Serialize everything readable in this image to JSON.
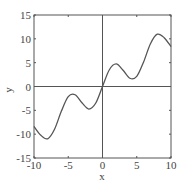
{
  "chart_data": {
    "type": "line",
    "title": "",
    "xlabel": "x",
    "ylabel": "y",
    "xlim": [
      -10,
      10
    ],
    "ylim": [
      -15,
      15
    ],
    "xticks": [
      -10,
      -5,
      0,
      5,
      10
    ],
    "yticks": [
      -15,
      -10,
      -5,
      0,
      5,
      10,
      15
    ],
    "xtick_labels": [
      "-10",
      "-5",
      "0",
      "5",
      "10"
    ],
    "ytick_labels": [
      "-15",
      "-10",
      "-5",
      "0",
      "5",
      "10",
      "15"
    ],
    "grid": false,
    "zero_lines": true,
    "legend": null,
    "series": [
      {
        "name": "y = x + 3 sin(x)",
        "color": "#555555",
        "x": [
          -10,
          -9,
          -8,
          -7,
          -6,
          -5,
          -4,
          -3,
          -2,
          -1,
          0,
          1,
          2,
          3,
          4,
          5,
          6,
          7,
          8,
          9,
          10
        ],
        "y": [
          -8.37,
          -10.24,
          -10.97,
          -8.97,
          -5.16,
          -2.12,
          -1.73,
          -3.42,
          -4.73,
          -3.52,
          0,
          3.52,
          4.73,
          3.42,
          1.73,
          2.12,
          5.16,
          8.97,
          10.97,
          10.24,
          8.37
        ]
      }
    ]
  },
  "labels": {
    "x": "x",
    "y": "y"
  }
}
